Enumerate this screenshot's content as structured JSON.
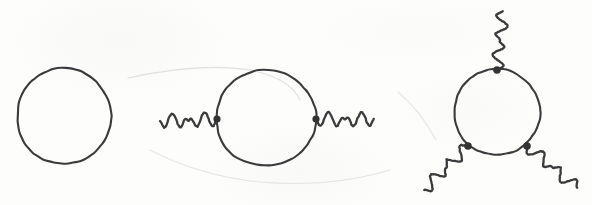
{
  "figure": {
    "style": "hand-drawn ink on off-white paper",
    "background_color": "#fdfdfc",
    "ink_color": "#3b3b3d",
    "vertex_color": "#333335",
    "canvas": {
      "width": 592,
      "height": 205
    },
    "diagrams": [
      {
        "id": "diagram-1",
        "name": "closed-fermion-loop",
        "label": "Closed loop, no external legs",
        "vertex_count": 0,
        "external_leg_count": 0,
        "loop": {
          "cx": 64,
          "cy": 116,
          "rx": 47,
          "ry": 48
        },
        "vertices": [],
        "photon_legs": []
      },
      {
        "id": "diagram-2",
        "name": "two-point-photon-self-energy",
        "label": "Two external photon legs",
        "vertex_count": 2,
        "external_leg_count": 2,
        "loop": {
          "cx": 266,
          "cy": 118,
          "rx": 50,
          "ry": 48
        },
        "vertices": [
          {
            "name": "vertex-left",
            "x": 217,
            "y": 119,
            "r": 3.6
          },
          {
            "name": "vertex-right",
            "x": 316,
            "y": 119,
            "r": 3.6
          }
        ],
        "photon_legs": [
          {
            "name": "photon-leg-left",
            "x1": 160,
            "y1": 121,
            "x2": 217,
            "y2": 119,
            "waves": 3.5,
            "amplitude": 7
          },
          {
            "name": "photon-leg-right",
            "x1": 316,
            "y1": 119,
            "x2": 374,
            "y2": 119,
            "waves": 3.5,
            "amplitude": 7
          }
        ]
      },
      {
        "id": "diagram-3",
        "name": "three-point-photon-vertex",
        "label": "Three external photon legs",
        "vertex_count": 3,
        "external_leg_count": 3,
        "loop": {
          "cx": 497,
          "cy": 112,
          "rx": 43,
          "ry": 43
        },
        "vertices": [
          {
            "name": "vertex-top",
            "x": 497,
            "y": 70,
            "r": 3.8
          },
          {
            "name": "vertex-bottom-left",
            "x": 468,
            "y": 146,
            "r": 3.8
          },
          {
            "name": "vertex-bottom-right",
            "x": 527,
            "y": 146,
            "r": 3.8
          }
        ],
        "photon_legs": [
          {
            "name": "photon-leg-top",
            "x1": 497,
            "y1": 70,
            "x2": 503,
            "y2": 11,
            "waves": 3.0,
            "amplitude": 6
          },
          {
            "name": "photon-leg-bottom-left",
            "x1": 468,
            "y1": 146,
            "x2": 424,
            "y2": 190,
            "waves": 3.0,
            "amplitude": 6
          },
          {
            "name": "photon-leg-bottom-right",
            "x1": 527,
            "y1": 146,
            "x2": 577,
            "y2": 188,
            "waves": 3.0,
            "amplitude": 6
          }
        ]
      }
    ]
  }
}
